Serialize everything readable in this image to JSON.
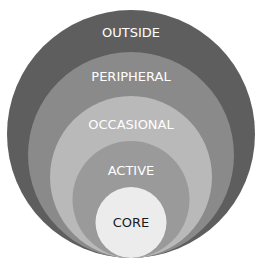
{
  "diagram": {
    "type": "nested-circles",
    "rings": [
      {
        "label": "OUTSIDE",
        "color": "#5e5e5e",
        "text_color": "#ffffff"
      },
      {
        "label": "PERIPHERAL",
        "color": "#8a8a8a",
        "text_color": "#ffffff"
      },
      {
        "label": "OCCASIONAL",
        "color": "#b9b9b9",
        "text_color": "#ffffff"
      },
      {
        "label": "ACTIVE",
        "color": "#9a9a9a",
        "text_color": "#ffffff"
      },
      {
        "label": "CORE",
        "color": "#ececec",
        "text_color": "#1a1a1a"
      }
    ]
  }
}
